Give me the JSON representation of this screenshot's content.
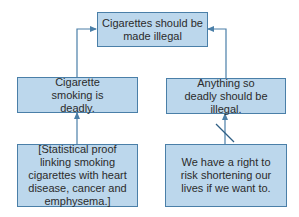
{
  "diagram": {
    "type": "argument-map",
    "colors": {
      "box_fill": "#bcd7ec",
      "box_border": "#4a7fa8",
      "line": "#4a7fa8",
      "text": "#2b2b2b"
    },
    "nodes": {
      "conclusion": {
        "text": "Cigarettes should be made illegal"
      },
      "premise_left": {
        "text": "Cigarette smoking is deadly."
      },
      "premise_right": {
        "text": "Anything so deadly should be illegal."
      },
      "evidence_left": {
        "text": "[Statistical proof linking smoking cigarettes with heart disease, cancer and emphysema.]"
      },
      "rebuttal_right": {
        "text": "We have a right to risk shortening our lives if we want to."
      }
    },
    "edges": [
      {
        "from": "premise_left",
        "to": "conclusion",
        "type": "support"
      },
      {
        "from": "premise_right",
        "to": "conclusion",
        "type": "support"
      },
      {
        "from": "evidence_left",
        "to": "premise_left",
        "type": "support"
      },
      {
        "from": "rebuttal_right",
        "to": "premise_right",
        "type": "objection",
        "marker": "slash"
      }
    ]
  }
}
